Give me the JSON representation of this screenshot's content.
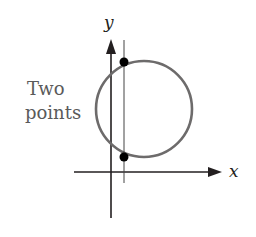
{
  "diagram": {
    "labels": {
      "y_axis": "y",
      "x_axis": "x",
      "annotation_line1": "Two",
      "annotation_line2": "points"
    },
    "colors": {
      "axis": "#231f20",
      "circle": "#6d6b6b",
      "annotation": "#5a5a5a",
      "points": "#000000"
    },
    "elements": {
      "circle": {
        "cx": 144,
        "cy": 109,
        "r": 48
      },
      "vertical_line_x": 124,
      "intersection_points": [
        {
          "x": 124,
          "y": 62
        },
        {
          "x": 124,
          "y": 157
        }
      ]
    }
  }
}
